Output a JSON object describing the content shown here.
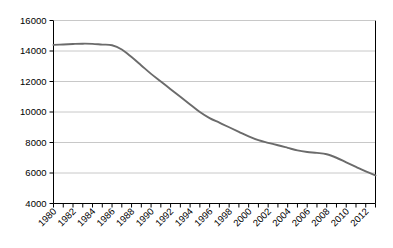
{
  "chart_data": {
    "type": "line",
    "title": "",
    "subtitle": "",
    "xlabel": "",
    "ylabel": "",
    "xlim": [
      1980,
      2013
    ],
    "ylim": [
      4000,
      16000
    ],
    "grid": true,
    "grid_axis": "y",
    "legend": false,
    "legend_position": "none",
    "line_color": "#6b6b6b",
    "grid_color": "#c8c8c8",
    "axis_color": "#000000",
    "background_color": "#ffffff",
    "y_ticks": [
      4000,
      6000,
      8000,
      10000,
      12000,
      14000,
      16000
    ],
    "y_tick_labels": [
      "4000",
      "6000",
      "8000",
      "10000",
      "12000",
      "14000",
      "16000"
    ],
    "x": [
      1980,
      1981,
      1982,
      1983,
      1984,
      1985,
      1986,
      1987,
      1988,
      1989,
      1990,
      1991,
      1992,
      1993,
      1994,
      1995,
      1996,
      1997,
      1998,
      1999,
      2000,
      2001,
      2002,
      2003,
      2004,
      2005,
      2006,
      2007,
      2008,
      2009,
      2010,
      2011,
      2012,
      2013
    ],
    "x_tick_labels": [
      "1980",
      "",
      "1982",
      "",
      "1984",
      "",
      "1986",
      "",
      "1988",
      "",
      "1990",
      "",
      "1992",
      "",
      "1994",
      "",
      "1996",
      "",
      "1998",
      "",
      "2000",
      "",
      "2002",
      "",
      "2004",
      "",
      "2006",
      "",
      "2008",
      "",
      "2010",
      "",
      "2012",
      ""
    ],
    "x_labels_shown": [
      "1980",
      "1982",
      "1984",
      "1986",
      "1988",
      "1990",
      "1992",
      "1994",
      "1996",
      "1998",
      "2000",
      "2002",
      "2004",
      "2006",
      "2008",
      "2010",
      "2012"
    ],
    "x_label_rotation": -45,
    "series": [
      {
        "name": "series-1",
        "color": "#6b6b6b",
        "values": [
          14400,
          14430,
          14460,
          14480,
          14470,
          14420,
          14380,
          14100,
          13600,
          13050,
          12500,
          12000,
          11500,
          11000,
          10500,
          10000,
          9600,
          9300,
          9000,
          8700,
          8400,
          8150,
          7980,
          7820,
          7650,
          7480,
          7380,
          7320,
          7230,
          7000,
          6700,
          6400,
          6100,
          5850
        ]
      }
    ]
  }
}
